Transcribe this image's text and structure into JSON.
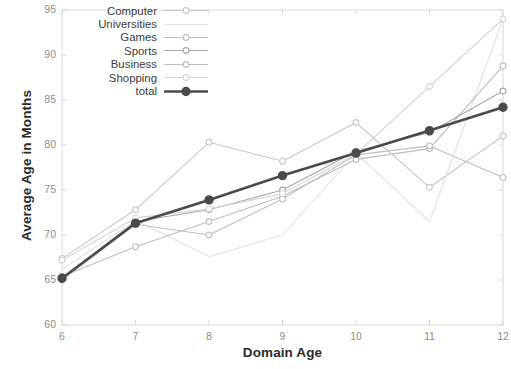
{
  "chart_data": {
    "type": "line",
    "title": "",
    "xlabel": "Domain Age",
    "ylabel": "Average Age in Months",
    "x": [
      6,
      7,
      8,
      9,
      10,
      11,
      12
    ],
    "xlim": [
      6,
      12
    ],
    "ylim": [
      60,
      95
    ],
    "xticks": [
      "6",
      "7",
      "8",
      "9",
      "10",
      "11",
      "12"
    ],
    "yticks": [
      "60",
      "65",
      "70",
      "75",
      "80",
      "85",
      "90",
      "95"
    ],
    "grid": false,
    "legend_position": "upper left",
    "series": [
      {
        "name": "Computer",
        "color": "#c8c8c8",
        "marker": "circle-open",
        "values": [
          67.4,
          72.8,
          80.3,
          78.2,
          82.5,
          75.3,
          81.0
        ]
      },
      {
        "name": "Universities",
        "color": "#e2e2e2",
        "marker": "none",
        "values": [
          66.2,
          71.6,
          67.6,
          70.0,
          79.1,
          71.5,
          94.0
        ]
      },
      {
        "name": "Games",
        "color": "#bdbdbd",
        "marker": "circle-open",
        "values": [
          65.4,
          68.7,
          71.5,
          74.3,
          78.4,
          79.6,
          88.8
        ]
      },
      {
        "name": "Sports",
        "color": "#a6a6a6",
        "marker": "circle-open",
        "values": [
          65.2,
          71.5,
          72.8,
          75.0,
          79.3,
          81.4,
          86.0
        ]
      },
      {
        "name": "Business",
        "color": "#bfbfbf",
        "marker": "circle-open",
        "values": [
          65.0,
          71.2,
          70.0,
          74.0,
          78.9,
          79.9,
          76.4
        ]
      },
      {
        "name": "Shopping",
        "color": "#d6d6d6",
        "marker": "circle-open",
        "values": [
          67.2,
          71.9,
          72.9,
          74.6,
          79.0,
          86.5,
          94.0
        ]
      },
      {
        "name": "total",
        "color": "#4a4a4a",
        "marker": "circle-filled",
        "values": [
          65.2,
          71.3,
          73.9,
          76.6,
          79.1,
          81.6,
          84.2
        ]
      }
    ]
  },
  "axes": {
    "frame_color": "#d9d9d9",
    "tick_color": "#8d8d8d"
  }
}
